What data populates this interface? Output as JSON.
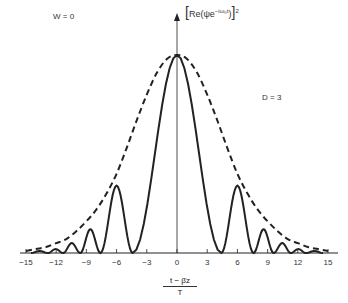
{
  "annotations": {
    "w_label": "W = 0",
    "d_label": "D = 3"
  },
  "axes": {
    "ylabel_prefix": "Re(ψe",
    "ylabel_exponent": "−iω₀t",
    "ylabel_suffix": ")",
    "ylabel_power": "2",
    "xlabel_numerator": "t − β̇z",
    "xlabel_denominator": "T"
  },
  "chart_data": {
    "type": "line",
    "title": "",
    "xlabel": "(t − β̇z) / T",
    "ylabel": "[Re(ψ e^(−iω₀t))]²",
    "xlim": [
      -15,
      15
    ],
    "ylim": [
      0,
      1.0
    ],
    "xticks": [
      -15,
      -12,
      -9,
      -6,
      -3,
      0,
      3,
      6,
      9,
      12,
      15
    ],
    "grid": false,
    "legend": null,
    "annotations": [
      "W = 0",
      "D = 3"
    ],
    "series": [
      {
        "name": "envelope (dashed)",
        "style": "dashed",
        "x": [
          -15,
          -14,
          -13,
          -12,
          -11,
          -10,
          -9,
          -8,
          -7,
          -6,
          -5,
          -4,
          -3,
          -2,
          -1,
          0,
          1,
          2,
          3,
          4,
          5,
          6,
          7,
          8,
          9,
          10,
          11,
          12,
          13,
          14,
          15
        ],
        "values": [
          0.01,
          0.02,
          0.03,
          0.05,
          0.07,
          0.11,
          0.16,
          0.22,
          0.3,
          0.4,
          0.53,
          0.67,
          0.8,
          0.91,
          0.98,
          1.0,
          0.98,
          0.91,
          0.8,
          0.67,
          0.53,
          0.4,
          0.3,
          0.22,
          0.16,
          0.11,
          0.07,
          0.05,
          0.03,
          0.02,
          0.01
        ]
      },
      {
        "name": "intensity (solid)",
        "style": "solid",
        "lobes": [
          {
            "start": -14.5,
            "end": -12.8,
            "peak": 0.01
          },
          {
            "start": -12.8,
            "end": -11.3,
            "peak": 0.02
          },
          {
            "start": -11.3,
            "end": -9.6,
            "peak": 0.05
          },
          {
            "start": -9.6,
            "end": -7.6,
            "peak": 0.12
          },
          {
            "start": -7.6,
            "end": -4.4,
            "peak": 0.34
          },
          {
            "start": -4.4,
            "end": 4.4,
            "peak": 1.0
          },
          {
            "start": 4.4,
            "end": 7.6,
            "peak": 0.34
          },
          {
            "start": 7.6,
            "end": 9.6,
            "peak": 0.12
          },
          {
            "start": 9.6,
            "end": 11.3,
            "peak": 0.05
          },
          {
            "start": 11.3,
            "end": 12.8,
            "peak": 0.02
          },
          {
            "start": 12.8,
            "end": 14.5,
            "peak": 0.01
          }
        ]
      }
    ]
  }
}
